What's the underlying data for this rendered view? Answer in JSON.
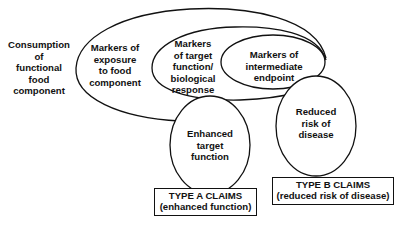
{
  "diagram": {
    "nodes": {
      "consumption": "Consumption\nof\nfunctional\nfood\ncomponent",
      "exposure": "Markers of\nexposure\nto food\ncomponent",
      "target": "Markers\nof target\nfunction/\nbiological\nresponse",
      "intermediate": "Markers of\nintermediate\nendpoint",
      "enhanced": "Enhanced\ntarget\nfunction",
      "reduced": "Reduced\nrisk of\ndisease"
    },
    "claims": {
      "type_a": {
        "title": "TYPE A CLAIMS",
        "subtitle": "(enhanced function)"
      },
      "type_b": {
        "title": "TYPE B CLAIMS",
        "subtitle": "(reduced risk of disease)"
      }
    },
    "colors": {
      "stroke": "#111111",
      "background": "#ffffff"
    }
  }
}
